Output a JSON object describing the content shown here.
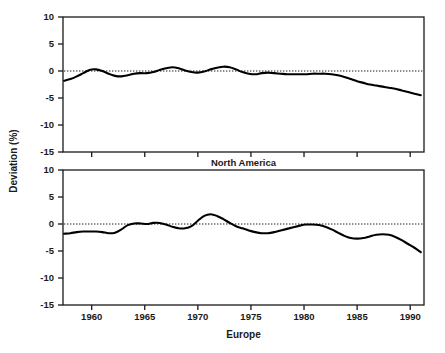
{
  "chart_data": [
    {
      "type": "line",
      "title": "North America",
      "xlabel": "",
      "ylabel": "Deviation (%)",
      "xlim": [
        1957.3,
        1991.3
      ],
      "ylim": [
        -15,
        10
      ],
      "grid": false,
      "legend": "none",
      "xticks": [
        1960,
        1965,
        1970,
        1975,
        1980,
        1985,
        1990
      ],
      "yticks": [
        10,
        5,
        0,
        -5,
        -10,
        -15
      ],
      "xtick_labels": [
        "1960",
        "1965",
        "1970",
        "1975",
        "1980",
        "1985",
        "1990"
      ],
      "ytick_labels": [
        "10",
        "5",
        "0",
        "-5",
        "-10",
        "-15"
      ],
      "annotations": [
        {
          "name": "zero-reference-line",
          "style": "dotted",
          "y": 0
        }
      ],
      "series": [
        {
          "name": "North America",
          "x": [
            1957.4,
            1958.0,
            1958.6,
            1959.2,
            1959.8,
            1960.4,
            1961.0,
            1961.6,
            1962.2,
            1962.8,
            1963.4,
            1964.0,
            1964.6,
            1965.2,
            1965.8,
            1966.4,
            1967.0,
            1967.6,
            1968.2,
            1968.8,
            1969.4,
            1970.0,
            1970.6,
            1971.2,
            1971.8,
            1972.4,
            1973.0,
            1973.6,
            1974.2,
            1974.8,
            1975.4,
            1976.0,
            1976.6,
            1977.2,
            1977.8,
            1978.4,
            1979.0,
            1979.6,
            1980.2,
            1980.8,
            1981.4,
            1982.0,
            1982.6,
            1983.2,
            1983.8,
            1984.4,
            1985.0,
            1985.6,
            1986.2,
            1986.8,
            1987.4,
            1988.0,
            1988.6,
            1989.2,
            1989.8,
            1990.4,
            1991.0
          ],
          "y": [
            -1.8,
            -1.5,
            -1.0,
            -0.4,
            0.2,
            0.3,
            0.0,
            -0.5,
            -0.9,
            -1.0,
            -0.8,
            -0.5,
            -0.4,
            -0.4,
            -0.2,
            0.2,
            0.5,
            0.7,
            0.5,
            0.1,
            -0.2,
            -0.3,
            -0.1,
            0.3,
            0.6,
            0.8,
            0.7,
            0.3,
            -0.2,
            -0.5,
            -0.6,
            -0.4,
            -0.3,
            -0.4,
            -0.5,
            -0.6,
            -0.6,
            -0.6,
            -0.6,
            -0.5,
            -0.5,
            -0.5,
            -0.6,
            -0.8,
            -1.1,
            -1.5,
            -1.9,
            -2.2,
            -2.5,
            -2.7,
            -2.9,
            -3.1,
            -3.3,
            -3.6,
            -3.9,
            -4.2,
            -4.5
          ]
        }
      ]
    },
    {
      "type": "line",
      "title": "Europe",
      "xlabel": "Europe",
      "ylabel": "Deviation (%)",
      "xlim": [
        1957.3,
        1991.3
      ],
      "ylim": [
        -15,
        10
      ],
      "grid": false,
      "legend": "none",
      "xticks": [
        1960,
        1965,
        1970,
        1975,
        1980,
        1985,
        1990
      ],
      "yticks": [
        10,
        5,
        0,
        -5,
        -10,
        -15
      ],
      "xtick_labels": [
        "1960",
        "1965",
        "1970",
        "1975",
        "1980",
        "1985",
        "1990"
      ],
      "ytick_labels": [
        "10",
        "5",
        "0",
        "-5",
        "-10",
        "-15"
      ],
      "annotations": [
        {
          "name": "zero-reference-line",
          "style": "dotted",
          "y": 0
        }
      ],
      "series": [
        {
          "name": "Europe",
          "x": [
            1957.4,
            1958.0,
            1958.6,
            1959.2,
            1959.8,
            1960.4,
            1961.0,
            1961.6,
            1962.2,
            1962.8,
            1963.4,
            1964.0,
            1964.6,
            1965.2,
            1965.8,
            1966.4,
            1967.0,
            1967.6,
            1968.2,
            1968.8,
            1969.4,
            1970.0,
            1970.6,
            1971.2,
            1971.8,
            1972.4,
            1973.0,
            1973.6,
            1974.2,
            1974.8,
            1975.4,
            1976.0,
            1976.6,
            1977.2,
            1977.8,
            1978.4,
            1979.0,
            1979.6,
            1980.2,
            1980.8,
            1981.4,
            1982.0,
            1982.6,
            1983.2,
            1983.8,
            1984.4,
            1985.0,
            1985.6,
            1986.2,
            1986.8,
            1987.4,
            1988.0,
            1988.6,
            1989.2,
            1989.8,
            1990.4,
            1991.0
          ],
          "y": [
            -1.8,
            -1.7,
            -1.5,
            -1.4,
            -1.4,
            -1.4,
            -1.5,
            -1.7,
            -1.6,
            -1.0,
            -0.2,
            0.1,
            0.1,
            0.0,
            0.2,
            0.2,
            -0.1,
            -0.5,
            -0.8,
            -0.8,
            -0.4,
            0.6,
            1.5,
            1.8,
            1.5,
            0.9,
            0.2,
            -0.4,
            -0.8,
            -1.2,
            -1.5,
            -1.7,
            -1.7,
            -1.5,
            -1.2,
            -0.9,
            -0.6,
            -0.3,
            -0.1,
            -0.1,
            -0.2,
            -0.5,
            -1.0,
            -1.6,
            -2.2,
            -2.6,
            -2.7,
            -2.6,
            -2.3,
            -2.0,
            -1.9,
            -2.0,
            -2.4,
            -3.0,
            -3.7,
            -4.4,
            -5.2
          ]
        }
      ]
    }
  ],
  "axis": {
    "y_title": "Deviation (%)"
  },
  "panels": {
    "top_label": "North America",
    "bottom_label": "Europe"
  }
}
